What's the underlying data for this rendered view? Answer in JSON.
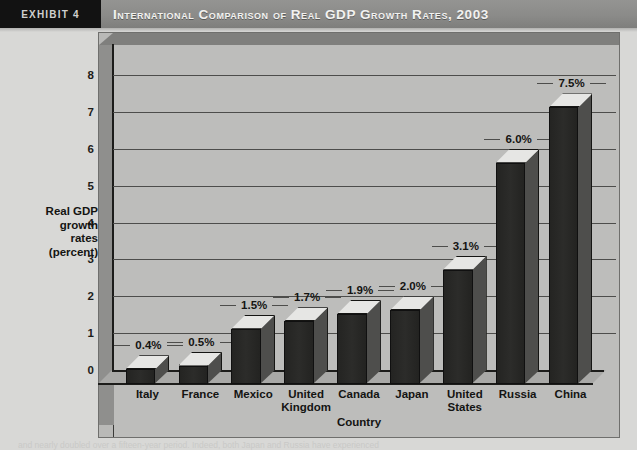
{
  "header": {
    "exhibit_label": "EXHIBIT 4",
    "title": "International Comparison of Real GDP Growth Rates, 2003",
    "bar_color": "#8b8b89",
    "exhibit_box_color": "#121212"
  },
  "footer": {
    "text": "and nearly doubled over a fifteen-year period. Indeed, both Japan and Russia have experienced"
  },
  "chart_data": {
    "type": "bar",
    "title": "International Comparison of Real GDP Growth Rates, 2003",
    "xlabel": "Country",
    "ylabel": "Real GDP growth rates (percent)",
    "ylabel_lines": [
      "Real GDP",
      "growth",
      "rates",
      "(percent)"
    ],
    "categories": [
      "Italy",
      "France",
      "Mexico",
      "United Kingdom",
      "Canada",
      "Japan",
      "United States",
      "Russia",
      "China"
    ],
    "category_lines": [
      [
        "Italy"
      ],
      [
        "France"
      ],
      [
        "Mexico"
      ],
      [
        "United",
        "Kingdom"
      ],
      [
        "Canada"
      ],
      [
        "Japan"
      ],
      [
        "United",
        "States"
      ],
      [
        "Russia"
      ],
      [
        "China"
      ]
    ],
    "values": [
      0.4,
      0.5,
      1.5,
      1.7,
      1.9,
      2.0,
      3.1,
      6.0,
      7.5
    ],
    "value_labels": [
      "0.4%",
      "0.5%",
      "1.5%",
      "1.7%",
      "1.9%",
      "2.0%",
      "3.1%",
      "6.0%",
      "7.5%"
    ],
    "ylim": [
      0,
      8
    ],
    "ytick_labels": [
      "8",
      "7",
      "6",
      "5",
      "4",
      "3",
      "2",
      "1",
      "0"
    ],
    "ytick_values": [
      8,
      7,
      6,
      5,
      4,
      3,
      2,
      1,
      0
    ],
    "grid": true,
    "legend": "none",
    "style": "3d-column",
    "colors": {
      "bar_front": "#262624",
      "bar_side": "#4e4e4c",
      "bar_top": "#e6e6e4",
      "plot_background": "#bdbdbb",
      "gridline": "#4d4d4b",
      "axis": "#1c1c1a"
    }
  }
}
